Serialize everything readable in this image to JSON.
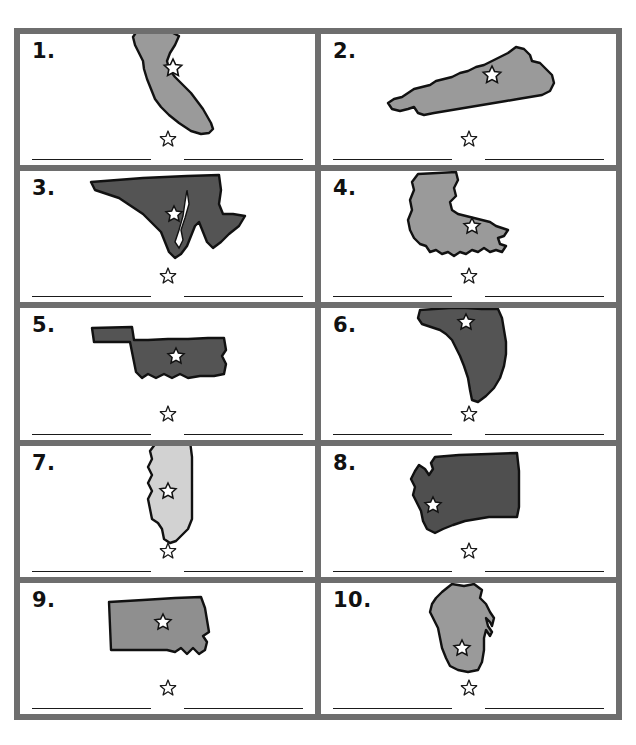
{
  "worksheet": {
    "title": "State Shapes Identification Worksheet",
    "header_watermark": "",
    "colors": {
      "grid_border": "#6e6e6e",
      "page_background": "#ffffff",
      "cell_background": "#ffffff",
      "number_color": "#111111",
      "line_color": "#1a1a1a",
      "shape_outline": "#111111",
      "fill_light": "#d2d2d2",
      "fill_medium": "#9a9a9a",
      "fill_dark": "#4f4f4f"
    },
    "layout": {
      "columns": 2,
      "rows": 5,
      "lines_per_cell": 2,
      "star_marker": "hollow-five-point-star"
    },
    "items": [
      {
        "number": "1.",
        "state": "California",
        "fill": "#9a9a9a",
        "capital_star": {
          "x": 60,
          "y": 40
        },
        "answer_name": "",
        "answer_capital": ""
      },
      {
        "number": "2.",
        "state": "Kentucky",
        "fill": "#9a9a9a",
        "capital_star": {
          "x": 86,
          "y": 35
        },
        "answer_name": "",
        "answer_capital": ""
      },
      {
        "number": "3.",
        "state": "Maryland",
        "fill": "#545454",
        "capital_star": {
          "x": 97,
          "y": 40
        },
        "answer_name": "",
        "answer_capital": ""
      },
      {
        "number": "4.",
        "state": "Louisiana",
        "fill": "#9a9a9a",
        "capital_star": {
          "x": 62,
          "y": 62
        },
        "answer_name": "",
        "answer_capital": ""
      },
      {
        "number": "5.",
        "state": "Oklahoma",
        "fill": "#545454",
        "capital_star": {
          "x": 82,
          "y": 42
        },
        "answer_name": "",
        "answer_capital": ""
      },
      {
        "number": "6.",
        "state": "Florida",
        "fill": "#545454",
        "capital_star": {
          "x": 56,
          "y": 14
        },
        "answer_name": "",
        "answer_capital": ""
      },
      {
        "number": "7.",
        "state": "Mississippi",
        "fill": "#d2d2d2",
        "capital_star": {
          "x": 42,
          "y": 48
        },
        "answer_name": "",
        "answer_capital": ""
      },
      {
        "number": "8.",
        "state": "Washington",
        "fill": "#4f4f4f",
        "capital_star": {
          "x": 34,
          "y": 60
        },
        "answer_name": "",
        "answer_capital": ""
      },
      {
        "number": "9.",
        "state": "South Dakota",
        "fill": "#8f8f8f",
        "capital_star": {
          "x": 60,
          "y": 33
        },
        "answer_name": "",
        "answer_capital": ""
      },
      {
        "number": "10.",
        "state": "Wisconsin",
        "fill": "#9a9a9a",
        "capital_star": {
          "x": 52,
          "y": 66
        },
        "answer_name": "",
        "answer_capital": ""
      }
    ]
  }
}
